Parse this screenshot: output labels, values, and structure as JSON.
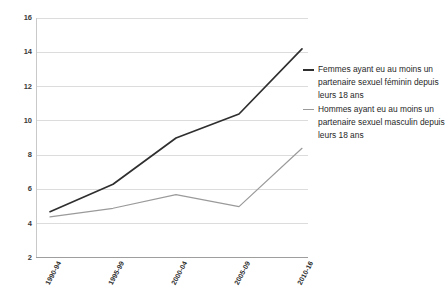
{
  "chart_data": {
    "type": "line",
    "title": "",
    "subtitle": "",
    "xlabel": "",
    "ylabel": "",
    "categories": [
      "1990-94",
      "1995-99",
      "2000-04",
      "2005-09",
      "2010-16"
    ],
    "series": [
      {
        "name": "Femmes ayant eu au moins un partenaire sexuel féminin depuis leurs 18 ans",
        "color": "#2f2f2f",
        "values": [
          4.7,
          6.3,
          9.0,
          10.4,
          14.2
        ]
      },
      {
        "name": "Hommes ayant eu au moins un partenaire sexuel masculin depuis leurs 18 ans",
        "color": "#9a9a9a",
        "values": [
          4.4,
          4.9,
          5.7,
          5.0,
          8.4
        ]
      }
    ],
    "ylim": [
      2,
      16
    ],
    "yticks": [
      2,
      4,
      6,
      8,
      10,
      12,
      14,
      16
    ],
    "ytick_labels": [
      "2",
      "4",
      "6",
      "8",
      "10",
      "12",
      "14",
      "16"
    ],
    "grid": true,
    "grid_axis": "y",
    "legend_position": "right",
    "markers": false
  },
  "legend": {
    "entries": [
      {
        "label": "Femmes ayant eu au moins un partenaire sexuel féminin depuis leurs 18 ans",
        "color": "#2f2f2f"
      },
      {
        "label": "Hommes ayant eu au moins un partenaire sexuel masculin depuis leurs 18 ans",
        "color": "#9a9a9a"
      }
    ]
  },
  "axes": {
    "y_tick_labels": [
      "16",
      "14",
      "12",
      "10",
      "8",
      "6",
      "4",
      "2"
    ],
    "x_tick_labels": [
      "1990-94",
      "1995-99",
      "2000-04",
      "2005-09",
      "2010-16"
    ]
  }
}
